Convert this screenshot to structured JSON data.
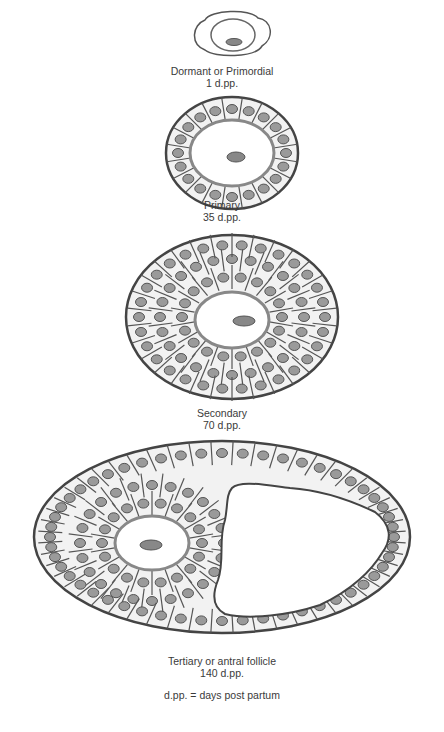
{
  "stages": [
    {
      "name": "Dormant or Primordial",
      "age": "1 d.pp."
    },
    {
      "name": "Primary",
      "age": "35 d.pp."
    },
    {
      "name": "Secondary",
      "age": "70 d.pp."
    },
    {
      "name": "Tertiary or antral follicle",
      "age": "140 d.pp."
    }
  ],
  "legend": "d.pp. = days post partum",
  "colors": {
    "outline": "#444444",
    "cell_fill": "#f2f2f2",
    "nucleus": "#9a9a9a",
    "zona": "#8a8a8a"
  }
}
